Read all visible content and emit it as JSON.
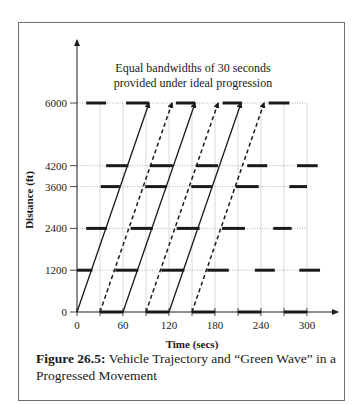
{
  "annotation": {
    "line1": "Equal bandwidths of 30 seconds",
    "line2": "provided under ideal progression"
  },
  "caption": {
    "label": "Figure 26.5:",
    "text": " Vehicle Trajectory and “Green Wave” in a Progressed Movement"
  },
  "chart_data": {
    "type": "time-space diagram",
    "title": "",
    "xlabel": "Time (secs)",
    "ylabel": "Distance (ft)",
    "xlim": [
      0,
      340
    ],
    "ylim": [
      0,
      6600
    ],
    "x_ticks": [
      0,
      60,
      120,
      180,
      240,
      300
    ],
    "x_minor_ticks": [
      30,
      90,
      150,
      210,
      270
    ],
    "y_ticks": [
      0,
      1200,
      2400,
      3600,
      4200,
      6000
    ],
    "grid": true,
    "signals": [
      {
        "distance": 0,
        "red_intervals": [
          [
            30,
            60
          ],
          [
            90,
            120
          ],
          [
            150,
            180
          ],
          [
            210,
            240
          ],
          [
            270,
            300
          ]
        ]
      },
      {
        "distance": 1200,
        "red_intervals": [
          [
            0,
            20
          ],
          [
            50,
            80
          ],
          [
            110,
            140
          ],
          [
            170,
            198
          ],
          [
            232,
            258
          ],
          [
            290,
            317
          ]
        ]
      },
      {
        "distance": 2400,
        "red_intervals": [
          [
            12,
            39
          ],
          [
            70,
            99
          ],
          [
            130,
            160
          ],
          [
            189,
            219
          ],
          [
            256,
            280
          ]
        ]
      },
      {
        "distance": 3600,
        "red_intervals": [
          [
            31,
            56
          ],
          [
            89,
            117
          ],
          [
            149,
            177
          ],
          [
            207,
            237
          ],
          [
            277,
            300
          ]
        ]
      },
      {
        "distance": 4200,
        "red_intervals": [
          [
            38,
            67
          ],
          [
            95,
            125
          ],
          [
            155,
            184
          ],
          [
            222,
            248
          ],
          [
            287,
            314
          ]
        ]
      },
      {
        "distance": 6000,
        "red_intervals": [
          [
            12,
            38
          ],
          [
            64,
            94
          ],
          [
            129,
            154
          ],
          [
            190,
            215
          ],
          [
            250,
            277
          ]
        ]
      }
    ],
    "trajectories": [
      {
        "style": "solid",
        "start": [
          0,
          0
        ],
        "end": [
          94,
          6000
        ]
      },
      {
        "style": "dashed",
        "start": [
          30,
          0
        ],
        "end": [
          124,
          6000
        ]
      },
      {
        "style": "solid",
        "start": [
          60,
          0
        ],
        "end": [
          154,
          6000
        ]
      },
      {
        "style": "dashed",
        "start": [
          90,
          0
        ],
        "end": [
          184,
          6000
        ]
      },
      {
        "style": "solid",
        "start": [
          120,
          0
        ],
        "end": [
          214,
          6000
        ]
      },
      {
        "style": "dashed",
        "start": [
          150,
          0
        ],
        "end": [
          244,
          6000
        ]
      }
    ],
    "annotations": [
      "Equal bandwidths of 30 seconds provided under ideal progression"
    ]
  }
}
